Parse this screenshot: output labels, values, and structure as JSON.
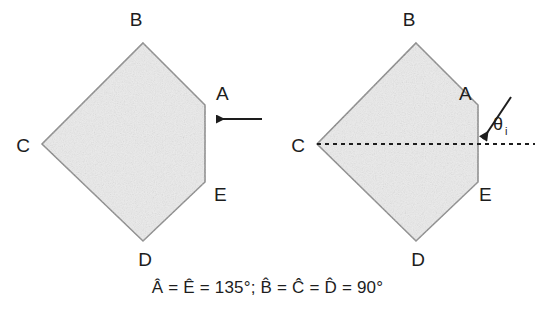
{
  "figure": {
    "caption": "Â = Ê = 135°; B̂ = Ĉ = D̂ = 90°",
    "fill_color": "#ebebeb",
    "stroke_color": "#7a7a7a",
    "ink_color": "#1d1d1d",
    "background_color": "#ffffff",
    "left_diagram": {
      "name": "normal-incidence-pentagon",
      "labels": {
        "a": "A",
        "b": "B",
        "c": "C",
        "d": "D",
        "e": "E"
      },
      "ray": {
        "description": "horizontal incoming arrow striking face AE",
        "direction": "leftward"
      }
    },
    "right_diagram": {
      "name": "oblique-incidence-pentagon",
      "labels": {
        "a": "A",
        "b": "B",
        "c": "C",
        "d": "D",
        "e": "E"
      },
      "angle_symbol": "θ",
      "angle_subscript": "i",
      "normal_line": "dashed horizontal line through C and face AE",
      "ray": {
        "description": "oblique incoming arrow striking face AE at angle theta-i",
        "direction": "down-left"
      }
    }
  }
}
